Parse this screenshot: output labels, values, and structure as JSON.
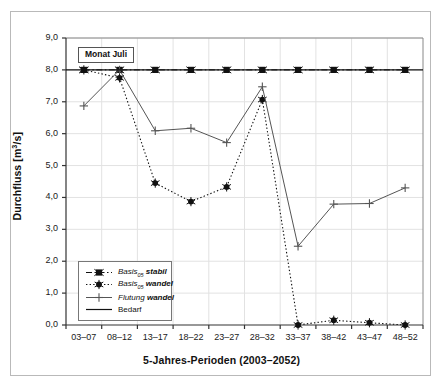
{
  "figure": {
    "annotation": "Monat Juli"
  },
  "chart_data": {
    "type": "line",
    "title": "",
    "xlabel": "5-Jahres-Perioden (2003–2052)",
    "ylabel": "Durchfluss [m³/s]",
    "ylabel_parts": {
      "text": "Durchfluss [m",
      "exp": "3",
      "tail": "/s]"
    },
    "categories": [
      "03–07",
      "08–12",
      "13–17",
      "18–22",
      "23–27",
      "28–32",
      "33–37",
      "38–42",
      "43–47",
      "48–52"
    ],
    "ylim": [
      0.0,
      9.0
    ],
    "yticks": [
      0.0,
      1.0,
      2.0,
      3.0,
      4.0,
      5.0,
      6.0,
      7.0,
      8.0,
      9.0
    ],
    "ytick_labels": [
      "0,0",
      "1,0",
      "2,0",
      "3,0",
      "4,0",
      "5,0",
      "6,0",
      "7,0",
      "8,0",
      "9,0"
    ],
    "grid": true,
    "legend_position": "lower-left-inside",
    "series": [
      {
        "name": "Basis05 stabil",
        "label_main": "Basis",
        "label_sub": "05",
        "label_tail": "stabil",
        "style": "dash-dot",
        "marker": "square-x",
        "color": "#111111",
        "values": [
          8.0,
          8.0,
          8.0,
          8.0,
          8.0,
          8.0,
          8.0,
          8.0,
          8.0,
          8.0
        ]
      },
      {
        "name": "Basis05 wandel",
        "label_main": "Basis",
        "label_sub": "05",
        "label_tail": "wandel",
        "style": "dotted",
        "marker": "star-dot",
        "color": "#111111",
        "values": [
          8.0,
          7.75,
          4.45,
          3.87,
          4.33,
          7.07,
          0.0,
          0.15,
          0.07,
          0.0
        ]
      },
      {
        "name": "Flutung wandel",
        "label_main": "Flutung",
        "label_sub": "",
        "label_tail": "wandel",
        "style": "solid",
        "marker": "plus",
        "color": "#555555",
        "values": [
          6.87,
          8.0,
          6.09,
          6.17,
          5.72,
          7.47,
          2.47,
          3.79,
          3.81,
          4.3
        ]
      },
      {
        "name": "Bedarf",
        "label_main": "Bedarf",
        "label_sub": "",
        "label_tail": "",
        "style": "solid-plain",
        "marker": "none",
        "color": "#111111",
        "constant": 8.0
      }
    ]
  },
  "legend": {
    "items": [
      {
        "text_main": "Basis",
        "text_sub": "05",
        "text_tail": "stabil",
        "sample": "dash-dot-square-x"
      },
      {
        "text_main": "Basis",
        "text_sub": "05",
        "text_tail": "wandel",
        "sample": "dotted-star"
      },
      {
        "text_main": "Flutung",
        "text_sub": "",
        "text_tail": "wandel",
        "sample": "solid-plus"
      },
      {
        "text_main": "Bedarf",
        "text_sub": "",
        "text_tail": "",
        "sample": "solid-plain"
      }
    ]
  },
  "colors": {
    "axis": "#333333",
    "grid": "#e2e2e2",
    "frame": "#b9b9b9",
    "text": "#111111",
    "flutung": "#555555"
  }
}
